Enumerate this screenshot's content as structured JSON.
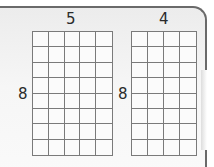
{
  "figure": {
    "type": "array-grids",
    "grids": [
      {
        "id": "grid-a",
        "columns": 5,
        "rows": 8,
        "top_label": "5",
        "side_label": "8"
      },
      {
        "id": "grid-b",
        "columns": 4,
        "rows": 8,
        "top_label": "4",
        "side_label": "8"
      }
    ],
    "colors": {
      "grid_line": "#7a7a7a",
      "panel_border": "#6a6a6a",
      "label": "#2a2a2a"
    }
  }
}
